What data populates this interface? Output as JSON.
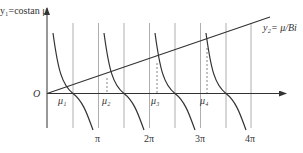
{
  "diagram": {
    "curve1_label": "y₁=costan μ",
    "curve2_label": "y₂= μ/Bi",
    "origin_label": "O",
    "roots": [
      "μ₁",
      "μ₂",
      "μ₃",
      "μ₄"
    ],
    "x_ticks": [
      "π",
      "2π",
      "3π",
      "4π"
    ],
    "colors": {
      "line": "#333333",
      "grid": "#888888",
      "background": "#ffffff"
    }
  }
}
